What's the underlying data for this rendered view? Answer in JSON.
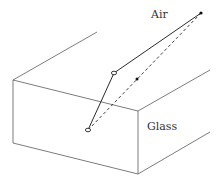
{
  "diagram": {
    "labels": {
      "air": "Air",
      "glass": "Glass"
    },
    "colors": {
      "background": "#ffffff",
      "box_edges": "#5a5a5a",
      "rays": "#2a2a2a",
      "text": "#333333"
    },
    "box": {
      "front_top_left": [
        13,
        80
      ],
      "front_top_right": [
        138,
        111
      ],
      "front_bottom_left": [
        13,
        143
      ],
      "front_bottom_right": [
        138,
        174
      ],
      "back_top_left_end": [
        97,
        32
      ],
      "back_top_right_end": [
        210,
        70
      ],
      "back_bottom_right_end": [
        210,
        132
      ]
    },
    "points": {
      "observer": [
        201,
        13
      ],
      "surface_entry": [
        114,
        73
      ],
      "object_bottom": [
        88,
        130
      ],
      "apparent_image": [
        137,
        79
      ]
    },
    "rays": [
      {
        "type": "solid",
        "from": "observer",
        "to": "surface_entry"
      },
      {
        "type": "solid",
        "from": "surface_entry",
        "to": "object_bottom"
      },
      {
        "type": "dashed",
        "from": "observer",
        "to": "object_bottom"
      }
    ]
  }
}
